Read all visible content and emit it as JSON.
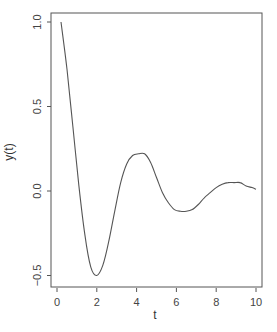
{
  "chart_data": {
    "type": "line",
    "title": "",
    "xlabel": "t",
    "ylabel": "y(t)",
    "xlim": [
      -0.3,
      10.3
    ],
    "ylim": [
      -0.56,
      1.06
    ],
    "grid": false,
    "legend": null,
    "x_ticks": [
      0,
      2,
      4,
      6,
      8,
      10
    ],
    "x_tick_labels": [
      "0",
      "2",
      "4",
      "6",
      "8",
      "10"
    ],
    "y_ticks": [
      1.0,
      0.5,
      0.0,
      -0.5
    ],
    "y_tick_labels": [
      "1.0",
      "0.5",
      "0.0",
      "-0.5"
    ],
    "series": [
      {
        "name": "y(t)",
        "color": "#555555",
        "x": [
          0.2,
          0.5,
          0.8,
          1.1,
          1.4,
          1.7,
          2.0,
          2.3,
          2.6,
          2.9,
          3.2,
          3.5,
          3.8,
          4.1,
          4.4,
          4.7,
          5.0,
          5.3,
          5.6,
          5.9,
          6.2,
          6.5,
          6.8,
          7.1,
          7.4,
          7.7,
          8.0,
          8.3,
          8.6,
          8.9,
          9.2,
          9.5,
          9.8,
          10.0
        ],
        "values": [
          1.0,
          0.72,
          0.38,
          0.03,
          -0.26,
          -0.45,
          -0.5,
          -0.44,
          -0.3,
          -0.12,
          0.05,
          0.16,
          0.21,
          0.22,
          0.22,
          0.17,
          0.08,
          -0.01,
          -0.07,
          -0.11,
          -0.12,
          -0.12,
          -0.11,
          -0.08,
          -0.04,
          -0.01,
          0.02,
          0.04,
          0.05,
          0.05,
          0.05,
          0.03,
          0.02,
          0.01
        ]
      }
    ]
  }
}
